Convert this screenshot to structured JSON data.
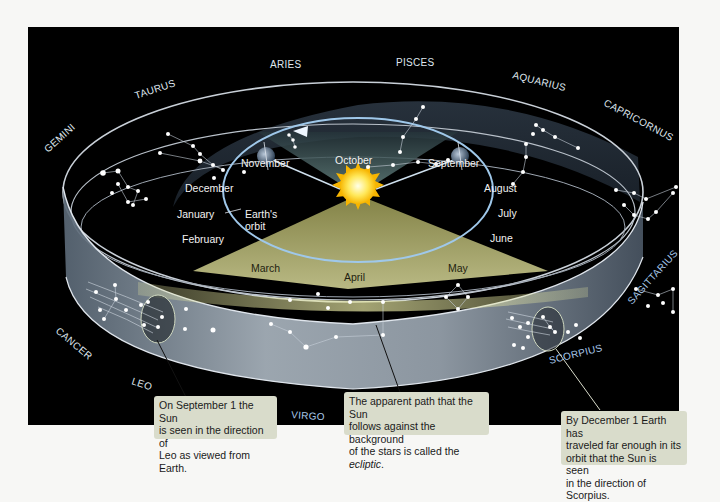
{
  "diagram": {
    "constellations": [
      "Gemini",
      "Taurus",
      "Aries",
      "Pisces",
      "Aquarius",
      "Capricornus",
      "Sagittarius",
      "Scorpius",
      "Libra",
      "Virgo",
      "Leo",
      "Cancer"
    ],
    "labels": {
      "gemini": "GEMINI",
      "taurus": "TAURUS",
      "aries": "ARIES",
      "pisces": "PISCES",
      "aquarius": "AQUARIUS",
      "capricornus": "CAPRICORNUS",
      "sagittarius": "SAGITTARIUS",
      "scorpius": "SCORPIUS",
      "libra": "LIBRA",
      "virgo": "VIRGO",
      "leo": "LEO",
      "cancer": "CANCER"
    },
    "months": {
      "november": "November",
      "october": "October",
      "september": "September",
      "december": "December",
      "august": "August",
      "january": "January",
      "july": "July",
      "february": "February",
      "june": "June",
      "march": "March",
      "april": "April",
      "may": "May"
    },
    "orbit_label_line1": "Earth's",
    "orbit_label_line2": "orbit",
    "callouts": {
      "leo": {
        "line1": "On September 1 the Sun",
        "line2": "is seen in the direction of",
        "line3": "Leo as viewed from Earth."
      },
      "ecliptic": {
        "line1": "The apparent path that the Sun",
        "line2": "follows against the background",
        "line3_prefix": "of the stars is called the ",
        "line3_term": "ecliptic",
        "line3_suffix": "."
      },
      "scorpius": {
        "line1": "By December 1 Earth has",
        "line2": "traveled far enough in its",
        "line3": "orbit that the Sun is seen",
        "line4": "in the direction of Scorpius."
      }
    },
    "colors": {
      "background": "#000000",
      "band": "#8d9aa8",
      "ecliptic_fill": "#c8c78a",
      "sun": "#ffd21a",
      "orbit": "#9fc8ea",
      "callout_bg": "#d9dccb"
    }
  }
}
